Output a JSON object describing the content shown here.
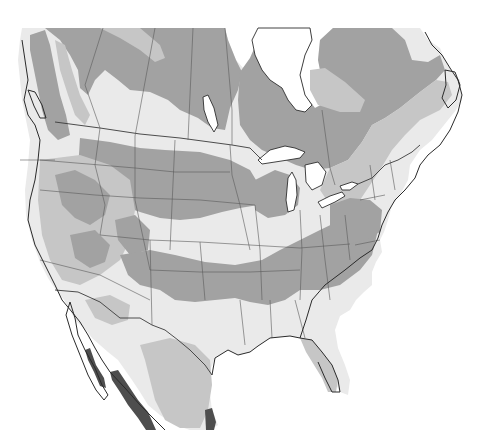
{
  "map": {
    "title": "",
    "region": "North America",
    "style": "grayscale zone map",
    "zones": [
      {
        "id": "zone-1",
        "shade": "very-light",
        "color": "#eaeaea"
      },
      {
        "id": "zone-2",
        "shade": "light",
        "color": "#c6c6c6"
      },
      {
        "id": "zone-3",
        "shade": "medium",
        "color": "#a2a2a2"
      },
      {
        "id": "zone-4",
        "shade": "dark",
        "color": "#4e4e4e"
      },
      {
        "id": "water",
        "shade": "white",
        "color": "#ffffff"
      }
    ],
    "labels": []
  }
}
